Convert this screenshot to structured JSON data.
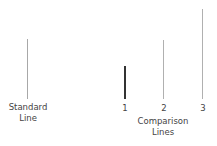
{
  "diagram": {
    "standard": {
      "label_line1": "Standard",
      "label_line2": "Line",
      "color": "#a8a8a8"
    },
    "comparison": {
      "lines": [
        {
          "label": "1",
          "color": "#333333"
        },
        {
          "label": "2",
          "color": "#b0b0b0"
        },
        {
          "label": "3",
          "color": "#b0b0b0"
        }
      ],
      "caption_line1": "Comparison",
      "caption_line2": "Lines"
    }
  }
}
